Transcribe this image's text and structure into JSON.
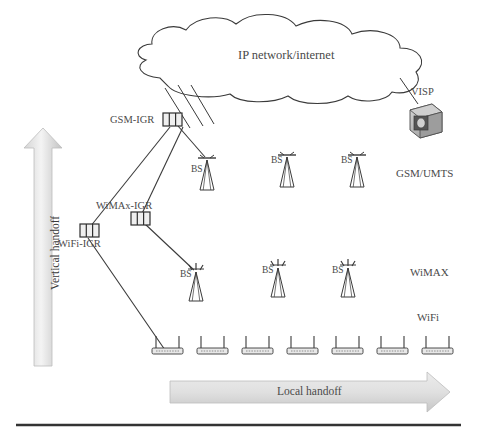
{
  "diagram": {
    "cloud": {
      "label": "IP network/internet",
      "name": "ip-cloud"
    },
    "visp": {
      "label": "VISP",
      "name": "visp-server"
    },
    "gateways": [
      {
        "id": "gsm-igr",
        "label": "GSM-IGR",
        "x": 171,
        "y": 120,
        "label_x": 110,
        "label_y": 115
      },
      {
        "id": "wimax-igr",
        "label": "WiMAx-IGR",
        "x": 139,
        "y": 219,
        "label_x": 96,
        "label_y": 203
      },
      {
        "id": "wifi-igr",
        "label": "WiFi-IGR",
        "x": 89,
        "y": 230,
        "label_x": 60,
        "label_y": 240
      }
    ],
    "base_stations_gsm": [
      {
        "label": "BS",
        "x": 207,
        "y": 160
      },
      {
        "label": "BS",
        "x": 287,
        "y": 157
      },
      {
        "label": "BS",
        "x": 357,
        "y": 157
      }
    ],
    "base_stations_wimax": [
      {
        "label": "BS",
        "x": 196,
        "y": 272
      },
      {
        "label": "BS",
        "x": 278,
        "y": 268
      },
      {
        "label": "BS",
        "x": 348,
        "y": 268
      }
    ],
    "access_points": [
      {
        "x": 167,
        "y": 348
      },
      {
        "x": 212,
        "y": 348
      },
      {
        "x": 257,
        "y": 348
      },
      {
        "x": 302,
        "y": 348
      },
      {
        "x": 347,
        "y": 348
      },
      {
        "x": 392,
        "y": 348
      },
      {
        "x": 437,
        "y": 348
      }
    ],
    "network_labels": [
      {
        "id": "gsm-umts",
        "label": "GSM/UMTS",
        "x": 398,
        "y": 174
      },
      {
        "id": "wimax",
        "label": "WiMAX",
        "x": 412,
        "y": 273
      },
      {
        "id": "wifi",
        "label": "WiFi",
        "x": 419,
        "y": 318
      }
    ],
    "arrows": {
      "vertical": {
        "label": "Vertical handoff",
        "name": "vertical-handoff-arrow"
      },
      "horizontal": {
        "label": "Local handoff",
        "name": "local-handoff-arrow"
      }
    },
    "colors": {
      "stroke": "#3a3a3a",
      "text": "#4a4a4a",
      "arrow_fill_light": "#f2f2f2",
      "arrow_fill_dark": "#c8c8c8",
      "device_fill": "#b9b9b9",
      "rule": "#333333"
    }
  }
}
